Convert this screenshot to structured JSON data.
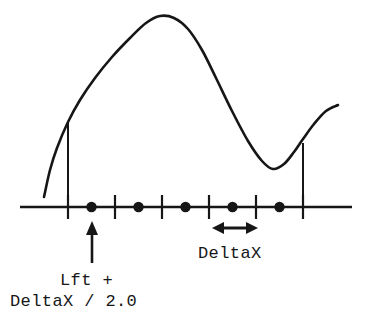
{
  "figure": {
    "background_color": "#ffffff",
    "ink_color": "#161616",
    "width": 367,
    "height": 316
  },
  "labels": {
    "deltax": "DeltaX",
    "midpoint_line1": "Lft +",
    "midpoint_line2": "DeltaX / 2.0"
  },
  "icons": {
    "up_arrow": "arrow-up-icon",
    "double_arrow": "double-headed-arrow-icon"
  },
  "chart_data": {
    "type": "line",
    "title": "",
    "xlabel": "",
    "ylabel": "",
    "grid": false,
    "legend_position": "none",
    "axis": {
      "x_start": 20,
      "x_end": 352,
      "y": 207
    },
    "interval": {
      "left_bound": 68,
      "right_bound": 303,
      "subintervals": 5,
      "delta_x_pixels": 47
    },
    "tick_positions": [
      68,
      115,
      162,
      209,
      256,
      303
    ],
    "midpoint_dots": [
      91.5,
      138.5,
      185.5,
      232.5,
      279.5
    ],
    "boundary_verticals": [
      {
        "x": 68,
        "y_top": 122,
        "y_bottom": 218
      },
      {
        "x": 303,
        "y_top": 143,
        "y_bottom": 218
      }
    ],
    "delta_x_arrow": {
      "x1": 212,
      "x2": 258,
      "y": 228
    },
    "midpoint_arrow": {
      "x": 92,
      "y_top": 221,
      "y_bottom": 263
    },
    "curve_points": [
      [
        44,
        197
      ],
      [
        50,
        170
      ],
      [
        57,
        148
      ],
      [
        68,
        122
      ],
      [
        80,
        100
      ],
      [
        95,
        78
      ],
      [
        112,
        57
      ],
      [
        130,
        38
      ],
      [
        146,
        23
      ],
      [
        160,
        16
      ],
      [
        174,
        18
      ],
      [
        188,
        29
      ],
      [
        202,
        50
      ],
      [
        216,
        78
      ],
      [
        232,
        111
      ],
      [
        248,
        141
      ],
      [
        262,
        161
      ],
      [
        273,
        169
      ],
      [
        284,
        164
      ],
      [
        294,
        152
      ],
      [
        303,
        139
      ],
      [
        314,
        124
      ],
      [
        326,
        111
      ],
      [
        338,
        105
      ]
    ]
  }
}
